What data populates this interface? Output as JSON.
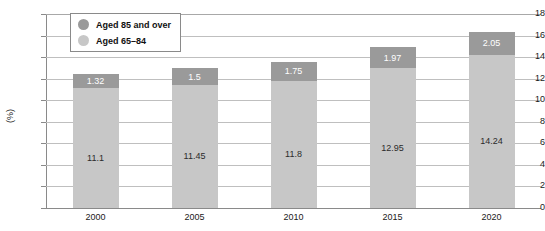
{
  "chart_data": {
    "type": "bar",
    "subtype": "stacked-bar",
    "title": "",
    "xlabel": "",
    "ylabel": "(%)",
    "ylim": [
      0,
      18
    ],
    "ytick_step": 2,
    "yticks": [
      0,
      2,
      4,
      6,
      8,
      10,
      12,
      14,
      16,
      18
    ],
    "grid": true,
    "grid_axis": "y",
    "legend_position": "top-left-inside",
    "categories": [
      "2000",
      "2005",
      "2010",
      "2015",
      "2020"
    ],
    "series": [
      {
        "name": "Aged 65–84",
        "color": "#c7c7c7",
        "values": [
          11.1,
          11.45,
          11.8,
          12.95,
          14.24
        ],
        "labels": [
          "11.1",
          "11.45",
          "11.8",
          "12.95",
          "14.24"
        ]
      },
      {
        "name": "Aged 85 and over",
        "color": "#9a9a9a",
        "values": [
          1.32,
          1.5,
          1.75,
          1.97,
          2.05
        ],
        "labels": [
          "1.32",
          "1.5",
          "1.75",
          "1.97",
          "2.05"
        ]
      }
    ],
    "stack_order_bottom_to_top": [
      "Aged 65–84",
      "Aged 85 and over"
    ],
    "totals": [
      12.42,
      12.95,
      13.55,
      14.92,
      16.29
    ]
  },
  "legend": {
    "items": [
      {
        "label": "Aged 85 and over",
        "color": "#9a9a9a"
      },
      {
        "label": "Aged 65–84",
        "color": "#c7c7c7"
      }
    ]
  },
  "axis": {
    "y_label": "(%)",
    "y_ticks": [
      "18",
      "16",
      "14",
      "12",
      "10",
      "8",
      "6",
      "4",
      "2",
      "0"
    ],
    "x_ticks": [
      "2000",
      "2005",
      "2010",
      "2015",
      "2020"
    ]
  }
}
